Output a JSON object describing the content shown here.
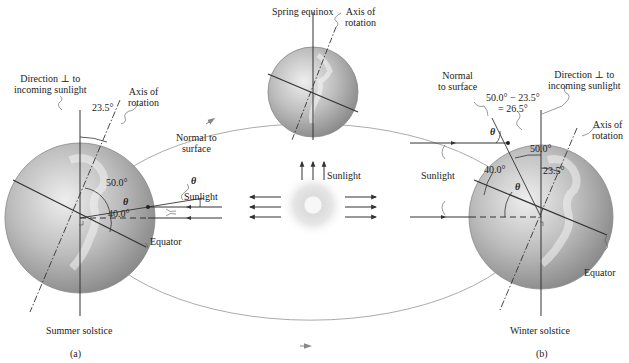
{
  "figure": {
    "top": {
      "title": "Spring equinox",
      "axis_label": [
        "Axis of",
        "rotation"
      ]
    },
    "left": {
      "direction_label": [
        "Direction ⊥ to",
        "incoming sunlight"
      ],
      "axis_label": [
        "Axis of",
        "rotation"
      ],
      "tilt_angle": "23.5°",
      "normal_label": [
        "Normal to",
        "surface"
      ],
      "theta": "θ",
      "theta2": "θ",
      "angle_50": "50.0°",
      "angle_40": "40.0°",
      "sunlight_label": "Sunlight",
      "equator_label": "Equator",
      "caption": "Summer solstice",
      "panel": "(a)"
    },
    "center": {
      "sunlight_label": "Sunlight"
    },
    "right": {
      "normal_label": [
        "Normal",
        "to surface"
      ],
      "formula": [
        "50.0° − 23.5°",
        "= 26.5°"
      ],
      "direction_label": [
        "Direction ⊥ to",
        "incoming sunlight"
      ],
      "axis_label": [
        "Axis of",
        "rotation"
      ],
      "theta": "θ",
      "theta2": "θ",
      "angle_50": "50.0°",
      "angle_40": "40.0°",
      "tilt_angle": "23.5°",
      "sunlight_label": "Sunlight",
      "equator_label": "Equator",
      "caption": "Winter solstice",
      "panel": "(b)"
    },
    "colors": {
      "line": "#333333",
      "orbit": "#9a9a9a",
      "globe_light": "#e4e4e4",
      "globe_dark": "#8c8c8c",
      "sun_core": "#fafafa",
      "sun_glow": "#d8d8d8"
    }
  }
}
